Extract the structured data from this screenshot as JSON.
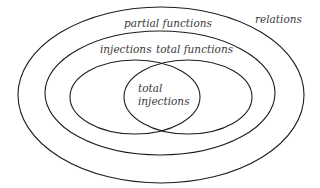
{
  "diagram": {
    "type": "euler-diagram",
    "sets": [
      {
        "id": "relations",
        "label": "relations"
      },
      {
        "id": "partial-functions",
        "label": "partial functions",
        "subset_of": "relations"
      },
      {
        "id": "injections",
        "label": "injections",
        "subset_of": "partial-functions"
      },
      {
        "id": "total-functions",
        "label": "total functions",
        "subset_of": "partial-functions"
      },
      {
        "id": "total-injections",
        "label_line1": "total",
        "label_line2": "injections",
        "intersection_of": [
          "injections",
          "total-functions"
        ]
      }
    ],
    "colors": {
      "stroke": "#1e1e1e",
      "text": "#3a3a3a",
      "background": "#ffffff"
    }
  }
}
